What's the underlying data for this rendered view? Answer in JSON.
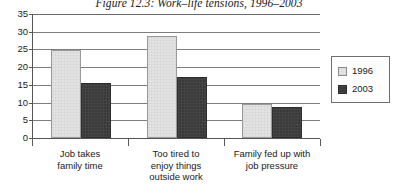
{
  "chart_data": {
    "type": "bar",
    "title": "Figure 12.3: Work–life tensions, 1996–2003",
    "categories": [
      "Job takes\nfamily time",
      "Too tired to\nenjoy things\noutside work",
      "Family fed up with\njob pressure"
    ],
    "category_lines": [
      [
        "Job takes",
        "family time"
      ],
      [
        "Too tired to",
        "enjoy things",
        "outside work"
      ],
      [
        "Family fed up with",
        "job pressure"
      ]
    ],
    "series": [
      {
        "name": "1996",
        "values": [
          24.6,
          28.5,
          9.5
        ],
        "color": "#e3e3e3"
      },
      {
        "name": "2003",
        "values": [
          15.4,
          17.2,
          8.7
        ],
        "color": "#3a3a3a"
      }
    ],
    "xlabel": "",
    "ylabel": "",
    "ylim": [
      0,
      35
    ],
    "yticks": [
      0,
      5,
      10,
      15,
      20,
      25,
      30,
      35
    ],
    "ytick_labels": [
      "0",
      "5",
      "10",
      "15",
      "20",
      "25",
      "30",
      "35"
    ],
    "grid": true,
    "legend_position": "right",
    "legend_entries": [
      "1996",
      "2003"
    ]
  },
  "colors": {
    "series_1996": "#e3e3e3",
    "series_2003": "#3a3a3a",
    "gridline": "#7d7d7d",
    "axis": "#555555",
    "text": "#1a1a1a",
    "background": "#ffffff"
  }
}
